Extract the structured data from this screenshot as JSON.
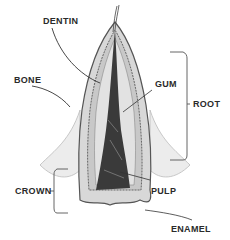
{
  "diagram": {
    "labels": {
      "dentin": "DENTIN",
      "bone": "BONE",
      "gum": "GUM",
      "root": "ROOT",
      "crown": "CROWN",
      "pulp": "PULP",
      "enamel": "ENAMEL"
    },
    "colors": {
      "ink": "#2a2a2a",
      "gum_fill": "#e6e6e6",
      "dentin_fill": "#c8c8c8",
      "pulp_fill": "#3a3a3a",
      "line": "#444444"
    }
  }
}
